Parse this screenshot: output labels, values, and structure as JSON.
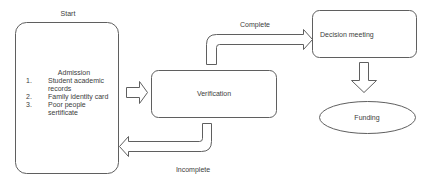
{
  "diagram": {
    "start_label": "Start",
    "admission": {
      "title": "Admission",
      "items": [
        {
          "number": "1.",
          "text": "Student academic records"
        },
        {
          "number": "2.",
          "text": "Family identity card"
        },
        {
          "number": "3.",
          "text": "Poor people sertificate"
        }
      ]
    },
    "verification_label": "Verification",
    "decision_label": "Decision meeting",
    "funding_label": "Funding",
    "complete_label": "Complete",
    "incomplete_label": "Incomplete",
    "colors": {
      "stroke": "#5f5f5f",
      "fill": "#ffffff",
      "text": "#3c3c3c"
    }
  }
}
